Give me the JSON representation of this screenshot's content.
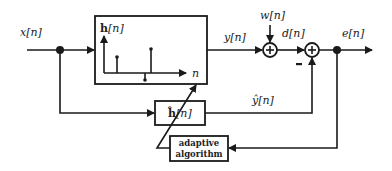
{
  "diagram": {
    "signals": {
      "input": "x[n]",
      "output": "y[n]",
      "noise": "w[n]",
      "desired": "d[n]",
      "error": "e[n]",
      "estimate": "ŷ[n]"
    },
    "blocks": {
      "unknown_system": {
        "label_bold": "h",
        "label_rest": "[n]",
        "axis_label": "n"
      },
      "adaptive_filter": {
        "label_bold": "ĥ",
        "label_rest": "[n]"
      },
      "algorithm": {
        "line1": "adaptive",
        "line2": "algorithm"
      }
    },
    "summers": {
      "sum1_symbol": "+",
      "sum2_symbol": "+",
      "minus_sign": "-"
    },
    "colors": {
      "stroke": "#1a1a1a",
      "background": "#ffffff"
    }
  }
}
